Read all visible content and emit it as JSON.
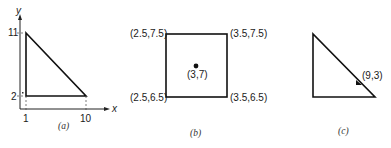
{
  "panels": [
    {
      "id": "a",
      "caption": "(a)",
      "axes": {
        "x_label": "x",
        "y_label": "y",
        "x_ticks": [
          "1",
          "10"
        ],
        "y_ticks": [
          "2",
          "11"
        ]
      },
      "shape": "right-triangle",
      "vertices": [
        [
          1,
          2
        ],
        [
          10,
          2
        ],
        [
          1,
          11
        ]
      ]
    },
    {
      "id": "b",
      "caption": "(b)",
      "shape": "square",
      "corners": {
        "top_left": "(2.5,7.5)",
        "top_right": "(3.5,7.5)",
        "bottom_left": "(2.5,6.5)",
        "bottom_right": "(3.5,6.5)"
      },
      "center_label": "(3,7)"
    },
    {
      "id": "c",
      "caption": "(c)",
      "shape": "right-triangle",
      "point_label": "(9,3)"
    }
  ]
}
